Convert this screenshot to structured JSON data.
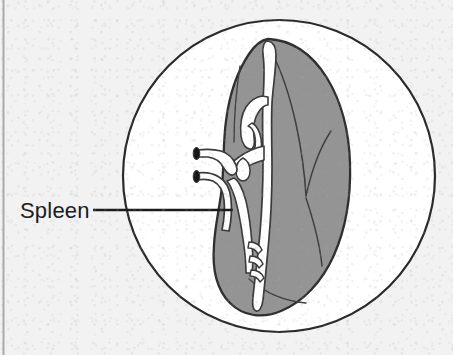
{
  "figure": {
    "kind": "anatomical-illustration",
    "subject": "spleen",
    "label": {
      "text": "Spleen",
      "color": "#1b1b1b",
      "x": 20,
      "y": 218
    },
    "leader_line": {
      "name": "leader-line",
      "color": "#1b1b1b",
      "x1": 93,
      "y1": 210,
      "x2": 233,
      "y2": 210,
      "width": 2.4
    },
    "circle_frame": {
      "name": "magnification-circle",
      "cx": 279,
      "cy": 176,
      "r": 156,
      "fill": "#ffffff",
      "stroke": "#2a2a2a",
      "stroke_width": 2.2
    },
    "organ": {
      "name": "spleen-body",
      "fill": "#949494",
      "stroke": "#2f2f2f",
      "stroke_width": 2.2
    },
    "vessels": {
      "name": "splenic-vessels",
      "fill": "#ffffff",
      "stroke": "#3a3a3a",
      "stroke_width": 1.6,
      "openings_fill": "#1a1a1a"
    },
    "background": {
      "page_fill": "#f2f2f2",
      "left_border_color": "#a9a9ae"
    }
  }
}
